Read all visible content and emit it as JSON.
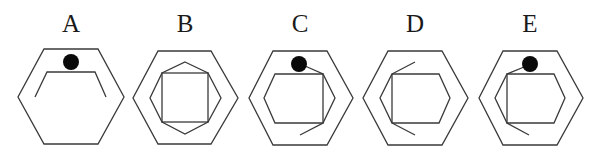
{
  "figures": [
    {
      "id": "A",
      "label": "A",
      "elements": [
        "outer-hexagon",
        "open-partial-hexagon-top",
        "black-dot-top"
      ]
    },
    {
      "id": "B",
      "label": "B",
      "elements": [
        "outer-hexagon",
        "inner-octagon",
        "inner-square"
      ]
    },
    {
      "id": "C",
      "label": "C",
      "elements": [
        "outer-hexagon",
        "inner-hexagon",
        "black-dot-top",
        "connector-line",
        "vertical-line",
        "diagonal-tail"
      ]
    },
    {
      "id": "D",
      "label": "D",
      "elements": [
        "outer-hexagon",
        "inner-hexagon",
        "vertical-line-left",
        "upper-tail",
        "lower-tail"
      ]
    },
    {
      "id": "E",
      "label": "E",
      "elements": [
        "outer-hexagon",
        "inner-hexagon",
        "black-dot-top",
        "connector-line",
        "vertical-line-left",
        "lower-tail"
      ]
    }
  ],
  "colors": {
    "line": "#3a3a3a",
    "dot": "#0a0a0a",
    "background": "#ffffff"
  }
}
